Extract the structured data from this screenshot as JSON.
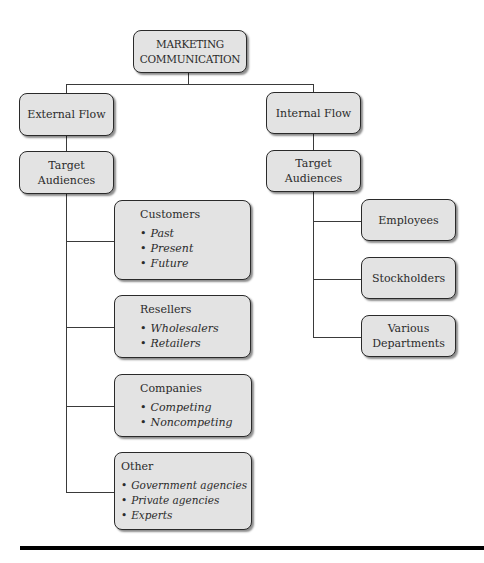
{
  "diagram": {
    "root": {
      "line1": "MARKETING",
      "line2": "COMMUNICATION"
    },
    "external": {
      "label": "External Flow",
      "target": {
        "line1": "Target",
        "line2": "Audiences"
      },
      "groups": [
        {
          "title": "Customers",
          "items": [
            "Past",
            "Present",
            "Future"
          ]
        },
        {
          "title": "Resellers",
          "items": [
            "Wholesalers",
            "Retailers"
          ]
        },
        {
          "title": "Companies",
          "items": [
            "Competing",
            "Noncompeting"
          ]
        },
        {
          "title": "Other",
          "items": [
            "Government agencies",
            "Private agencies",
            "Experts"
          ]
        }
      ]
    },
    "internal": {
      "label": "Internal Flow",
      "target": {
        "line1": "Target",
        "line2": "Audiences"
      },
      "groups": [
        {
          "line1": "Employees",
          "line2": ""
        },
        {
          "line1": "Stockholders",
          "line2": ""
        },
        {
          "line1": "Various",
          "line2": "Departments"
        }
      ]
    },
    "bullet": "•",
    "colors": {
      "box_fill": "#e3e3e3",
      "box_border": "#2a2a2a",
      "line": "#3a3a3a",
      "rule": "#000000"
    }
  }
}
